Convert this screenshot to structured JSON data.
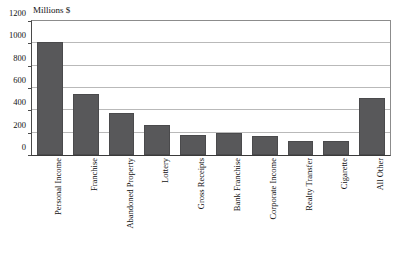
{
  "chart_data": {
    "type": "bar",
    "title": "",
    "ylabel": "Millions $",
    "xlabel": "",
    "ylim": [
      0,
      1200
    ],
    "yticks": [
      0,
      200,
      400,
      600,
      800,
      1000,
      1200
    ],
    "ytick_labels": [
      "0",
      "200",
      "400",
      "600",
      "800",
      "1000",
      "1200"
    ],
    "grid": true,
    "legend": "none",
    "bar_color": "#58585a",
    "categories": [
      "Personal Income",
      "Franchise",
      "Abandoned Property",
      "Lottery",
      "Gross Receipts",
      "Bank Franchise",
      "Corporate Income",
      "Realty Transfer",
      "Cigarette",
      "All Other"
    ],
    "values": [
      1010,
      550,
      375,
      272,
      180,
      198,
      168,
      122,
      127,
      510
    ]
  }
}
